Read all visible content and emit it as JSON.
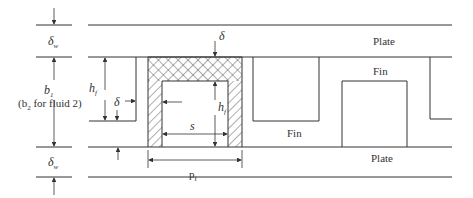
{
  "diagram": {
    "labels": {
      "plate_top": "Plate",
      "plate_bottom": "Plate",
      "fin_upper": "Fin",
      "fin_lower": "Fin",
      "delta_w_top": "δ",
      "delta_w_top_sub": "w",
      "delta_w_bottom": "δ",
      "delta_w_bottom_sub": "w",
      "b1": "b",
      "b1_sub": "1",
      "b2_note_open": "(b",
      "b2_note_sub": "2",
      "b2_note_rest": " for fluid 2)",
      "hf_left": "h",
      "hf_left_sub": "f",
      "hf_center": "h",
      "hf_center_sub": "f",
      "delta_left": "δ",
      "delta_top": "δ",
      "s": "s",
      "pf": "p",
      "pf_sub": "f"
    },
    "colors": {
      "line": "#333333",
      "background": "#ffffff"
    }
  }
}
